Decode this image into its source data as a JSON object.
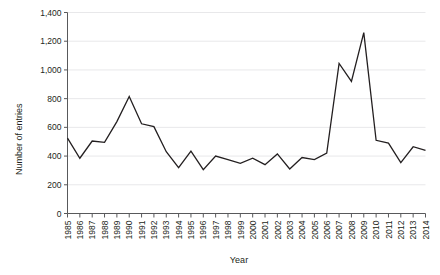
{
  "chart_data": {
    "type": "line",
    "title": "",
    "xlabel": "Year",
    "ylabel": "Number of entries",
    "xlim": [
      1985,
      2014
    ],
    "ylim": [
      0,
      1400
    ],
    "grid": true,
    "legend": false,
    "legend_position": "none",
    "line_color": "#231f20",
    "y_ticks": [
      0,
      200,
      400,
      600,
      800,
      1000,
      1200,
      1400
    ],
    "y_tick_labels": [
      "0",
      "200",
      "400",
      "600",
      "800",
      "1,000",
      "1,200",
      "1,400"
    ],
    "categories": [
      "1985",
      "1986",
      "1987",
      "1988",
      "1989",
      "1990",
      "1991",
      "1992",
      "1993",
      "1994",
      "1995",
      "1996",
      "1997",
      "1998",
      "1999",
      "2000",
      "2001",
      "2002",
      "2003",
      "2004",
      "2005",
      "2006",
      "2007",
      "2008",
      "2009",
      "2010",
      "2011",
      "2012",
      "2013",
      "2014"
    ],
    "series": [
      {
        "name": "Number of entries",
        "values": [
          525,
          385,
          505,
          495,
          640,
          815,
          625,
          605,
          430,
          320,
          435,
          305,
          400,
          375,
          350,
          385,
          340,
          415,
          310,
          390,
          375,
          420,
          1045,
          920,
          1260,
          510,
          490,
          355,
          465,
          440
        ]
      }
    ]
  },
  "axis": {
    "x_title": "Year",
    "y_title": "Number of entries"
  }
}
